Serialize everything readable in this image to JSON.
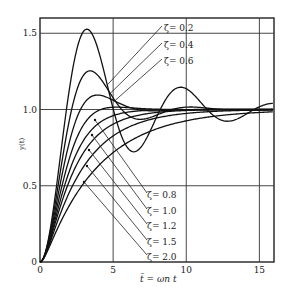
{
  "chart_data": {
    "type": "line",
    "title": "",
    "xlabel": "t̄ = ωn t",
    "ylabel": "y(t)",
    "xlim": [
      0,
      16
    ],
    "ylim": [
      0,
      1.6
    ],
    "x_ticks": [
      0,
      5,
      10,
      15
    ],
    "y_ticks": [
      0,
      0.5,
      1.0,
      1.5
    ],
    "x_tick_labels": [
      "0",
      "5",
      "10",
      "15"
    ],
    "y_tick_labels": [
      "0",
      "0.5",
      "1.0",
      "1.5"
    ],
    "grid": true,
    "legend_position": "inline labels with leader lines",
    "series": [
      {
        "name": "ζ = 0.2",
        "zeta": 0.2,
        "label": "ζ= 0.2",
        "peak": 1.53,
        "peak_t": 3.2
      },
      {
        "name": "ζ = 0.4",
        "zeta": 0.4,
        "label": "ζ= 0.4",
        "peak": 1.25,
        "peak_t": 3.4
      },
      {
        "name": "ζ = 0.6",
        "zeta": 0.6,
        "label": "ζ= 0.6",
        "peak": 1.09,
        "peak_t": 3.9
      },
      {
        "name": "ζ = 0.8",
        "zeta": 0.8,
        "label": "ζ= 0.8",
        "peak": 1.015,
        "peak_t": 5.2
      },
      {
        "name": "ζ = 1.0",
        "zeta": 1.0,
        "label": "ζ= 1.0"
      },
      {
        "name": "ζ = 1.2",
        "zeta": 1.2,
        "label": "ζ= 1.2"
      },
      {
        "name": "ζ = 1.5",
        "zeta": 1.5,
        "label": "ζ= 1.5"
      },
      {
        "name": "ζ = 2.0",
        "zeta": 2.0,
        "label": "ζ= 2.0"
      }
    ]
  },
  "axis": {
    "xlabel": "t̄ = ωn t",
    "ylabel": "y(t)"
  }
}
